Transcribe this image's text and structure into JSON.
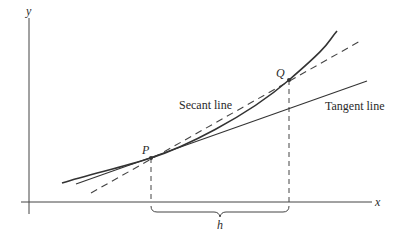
{
  "diagram": {
    "axes": {
      "x_label": "x",
      "y_label": "y"
    },
    "points": [
      {
        "id": "P",
        "label": "P",
        "x": 151,
        "y": 158
      },
      {
        "id": "Q",
        "label": "Q",
        "x": 289,
        "y": 80
      }
    ],
    "lines": {
      "secant_label": "Secant line",
      "tangent_label": "Tangent line"
    },
    "interval": {
      "label": "h"
    },
    "colors": {
      "stroke": "#333333",
      "text": "#2a2a2a",
      "background": "#ffffff"
    }
  }
}
